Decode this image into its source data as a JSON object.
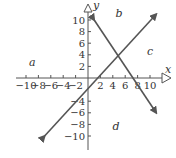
{
  "chart_data": {
    "type": "line",
    "title": "",
    "xlabel": "x",
    "ylabel": "y",
    "xlim": [
      -11,
      12
    ],
    "ylim": [
      -12,
      12
    ],
    "grid": false,
    "x_ticks": [
      -10,
      -8,
      -6,
      -4,
      -2,
      2,
      4,
      6,
      8,
      10
    ],
    "x_tick_labels": [
      "−10",
      "−8",
      "−6",
      "−4",
      "−2",
      "2",
      "4",
      "6",
      "8",
      "10"
    ],
    "y_ticks": [
      10,
      8,
      6,
      4,
      2,
      -4,
      -6,
      -8,
      -10
    ],
    "y_tick_labels": [
      "10",
      "8",
      "6",
      "4",
      "2",
      "−4",
      "−6",
      "−8",
      "−10"
    ],
    "series": [
      {
        "name": "increasing line",
        "x": [
          -7,
          11
        ],
        "y": [
          -10,
          11
        ],
        "color": "#555555"
      },
      {
        "name": "decreasing line",
        "x": [
          1,
          11
        ],
        "y": [
          10,
          -6
        ],
        "color": "#555555"
      }
    ],
    "intersection": {
      "x": 5,
      "y": 4
    },
    "annotations": [
      {
        "text": "a",
        "x": -9,
        "y": 2
      },
      {
        "text": "b",
        "x": 5,
        "y": 10.5
      },
      {
        "text": "c",
        "x": 10,
        "y": 4
      },
      {
        "text": "d",
        "x": 4.5,
        "y": -9
      }
    ]
  },
  "labels": {
    "x_axis": "x",
    "y_axis": "y",
    "region_a": "a",
    "region_b": "b",
    "region_c": "c",
    "region_d": "d"
  }
}
